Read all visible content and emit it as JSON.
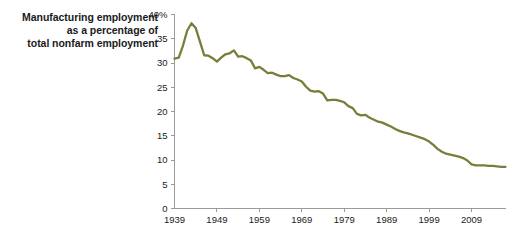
{
  "title": {
    "line1": "Manufacturing employment",
    "line2": "as a percentage of",
    "line3": "total nonfarm employment"
  },
  "colors": {
    "line": "#7a7c3a",
    "axis": "#9a9a9a",
    "text": "#1b1b1b",
    "background": "#ffffff"
  },
  "axes": {
    "y_ticks": [
      "40%",
      "35",
      "30",
      "25",
      "20",
      "15",
      "10",
      "5",
      "0"
    ],
    "x_ticks": [
      "1939",
      "1949",
      "1959",
      "1969",
      "1979",
      "1989",
      "1999",
      "2009"
    ]
  },
  "chart_data": {
    "type": "line",
    "title": "Manufacturing employment as a percentage of total nonfarm employment",
    "xlabel": "",
    "ylabel": "Manufacturing employment as a percentage of total nonfarm employment",
    "xlim": [
      1939,
      2017
    ],
    "ylim": [
      0,
      40
    ],
    "ytick_values": [
      0,
      5,
      10,
      15,
      20,
      25,
      30,
      35,
      40
    ],
    "ytick_labels": [
      "0",
      "5",
      "10",
      "15",
      "20",
      "25",
      "30",
      "35",
      "40%"
    ],
    "xtick_values": [
      1939,
      1949,
      1959,
      1969,
      1979,
      1989,
      1999,
      2009
    ],
    "xtick_labels": [
      "1939",
      "1949",
      "1959",
      "1969",
      "1979",
      "1989",
      "1999",
      "2009"
    ],
    "grid": false,
    "legend": false,
    "series": [
      {
        "name": "Manufacturing share of nonfarm employment",
        "color": "#7a7c3a",
        "x": [
          1939,
          1940,
          1941,
          1942,
          1943,
          1944,
          1945,
          1946,
          1947,
          1948,
          1949,
          1950,
          1951,
          1952,
          1953,
          1954,
          1955,
          1956,
          1957,
          1958,
          1959,
          1960,
          1961,
          1962,
          1963,
          1964,
          1965,
          1966,
          1967,
          1968,
          1969,
          1970,
          1971,
          1972,
          1973,
          1974,
          1975,
          1976,
          1977,
          1978,
          1979,
          1980,
          1981,
          1982,
          1983,
          1984,
          1985,
          1986,
          1987,
          1988,
          1989,
          1990,
          1991,
          1992,
          1993,
          1994,
          1995,
          1996,
          1997,
          1998,
          1999,
          2000,
          2001,
          2002,
          2003,
          2004,
          2005,
          2006,
          2007,
          2008,
          2009,
          2010,
          2011,
          2012,
          2013,
          2014,
          2015,
          2016,
          2017
        ],
        "y": [
          30.9,
          31.1,
          33.6,
          36.7,
          38.2,
          37.2,
          34.4,
          31.6,
          31.5,
          31.0,
          30.3,
          31.1,
          31.8,
          32.0,
          32.6,
          31.3,
          31.4,
          31.0,
          30.5,
          28.9,
          29.2,
          28.6,
          27.9,
          28.0,
          27.6,
          27.3,
          27.3,
          27.5,
          26.9,
          26.6,
          26.2,
          25.1,
          24.3,
          24.1,
          24.2,
          23.7,
          22.3,
          22.4,
          22.4,
          22.2,
          21.9,
          21.1,
          20.7,
          19.5,
          19.2,
          19.3,
          18.7,
          18.3,
          17.9,
          17.7,
          17.3,
          16.9,
          16.4,
          16.0,
          15.7,
          15.5,
          15.2,
          14.9,
          14.6,
          14.3,
          13.8,
          13.1,
          12.3,
          11.7,
          11.3,
          11.1,
          10.9,
          10.7,
          10.4,
          9.9,
          9.1,
          8.9,
          8.9,
          8.9,
          8.8,
          8.8,
          8.7,
          8.6,
          8.6
        ]
      }
    ]
  }
}
